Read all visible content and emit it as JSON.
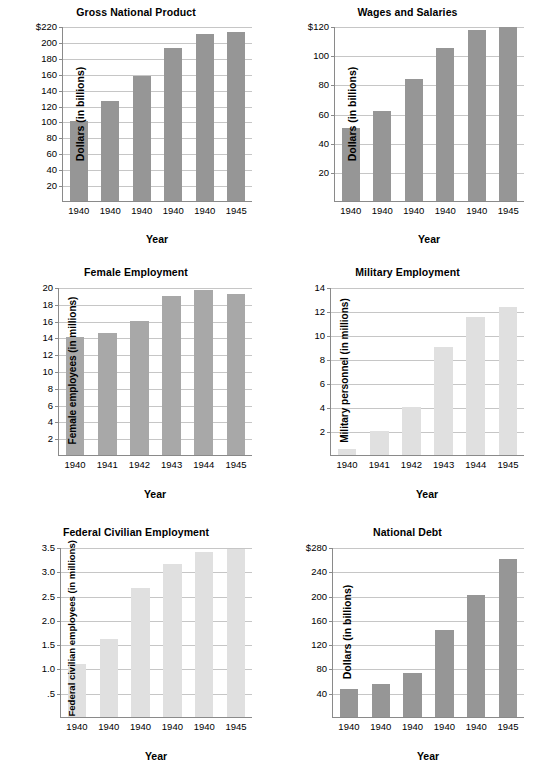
{
  "page": {
    "width": 543,
    "height": 778,
    "background": "#ffffff",
    "layout": "2 columns x 3 rows of bar charts"
  },
  "colors": {
    "bar_dark": "#969696",
    "bar_medium": "#a8a8a8",
    "bar_light": "#e0e0e0",
    "axis": "#8a8a8a",
    "gridline": "#c6c6c6",
    "text": "#000000"
  },
  "chart_data": [
    {
      "id": "gross-national-product",
      "type": "bar",
      "title": "Gross National Product",
      "xlabel": "Year",
      "ylabel": "Dollars (in billions)",
      "categories": [
        "1940",
        "1940",
        "1940",
        "1940",
        "1940",
        "1945"
      ],
      "values": [
        100,
        126,
        157,
        192,
        210,
        212
      ],
      "yticks": [
        "$220",
        "200",
        "180",
        "160",
        "140",
        "120",
        "100",
        "80",
        "60",
        "40",
        "20"
      ],
      "ytick_values": [
        220,
        200,
        180,
        160,
        140,
        120,
        100,
        80,
        60,
        40,
        20
      ],
      "ylim": [
        0,
        220
      ],
      "grid": true,
      "bar_color": "#969696"
    },
    {
      "id": "wages-and-salaries",
      "type": "bar",
      "title": "Wages and Salaries",
      "xlabel": "Year",
      "ylabel": "Dollars (in billions)",
      "categories": [
        "1940",
        "1940",
        "1940",
        "1940",
        "1940",
        "1945"
      ],
      "values": [
        50,
        62,
        84,
        105,
        117,
        119
      ],
      "yticks": [
        "$120",
        "100",
        "80",
        "60",
        "40",
        "20"
      ],
      "ytick_values": [
        120,
        100,
        80,
        60,
        40,
        20
      ],
      "ylim": [
        0,
        120
      ],
      "grid": true,
      "bar_color": "#969696"
    },
    {
      "id": "female-employment",
      "type": "bar",
      "title": "Female Employment",
      "xlabel": "Year",
      "ylabel": "Female employees (in millions)",
      "categories": [
        "1940",
        "1941",
        "1942",
        "1943",
        "1944",
        "1945"
      ],
      "values": [
        14.1,
        14.5,
        16.0,
        18.9,
        19.7,
        19.2
      ],
      "yticks": [
        "20",
        "18",
        "16",
        "14",
        "12",
        "10",
        "8",
        "6",
        "4",
        "2"
      ],
      "ytick_values": [
        20,
        18,
        16,
        14,
        12,
        10,
        8,
        6,
        4,
        2
      ],
      "ylim": [
        0,
        20
      ],
      "grid": true,
      "bar_color": "#a8a8a8"
    },
    {
      "id": "military-employment",
      "type": "bar",
      "title": "Military Employment",
      "xlabel": "Year",
      "ylabel": "Military personnel (in millions)",
      "categories": [
        "1940",
        "1941",
        "1942",
        "1943",
        "1944",
        "1945"
      ],
      "values": [
        0.5,
        2.0,
        4.0,
        9.0,
        11.5,
        12.3
      ],
      "yticks": [
        "14",
        "12",
        "10",
        "8",
        "6",
        "4",
        "2"
      ],
      "ytick_values": [
        14,
        12,
        10,
        8,
        6,
        4,
        2
      ],
      "ylim": [
        0,
        14
      ],
      "grid": true,
      "bar_color": "#e0e0e0"
    },
    {
      "id": "federal-civilian-employment",
      "type": "bar",
      "title": "Federal Civilian Employment",
      "xlabel": "Year",
      "ylabel": "Federal civilian employees (in millions)",
      "categories": [
        "1940",
        "1940",
        "1940",
        "1940",
        "1940",
        "1945"
      ],
      "values": [
        1.1,
        1.6,
        2.65,
        3.15,
        3.4,
        3.45
      ],
      "yticks": [
        "3.5",
        "3.0",
        "2.5",
        "2.0",
        "1.5",
        "1.0",
        ".5"
      ],
      "ytick_values": [
        3.5,
        3.0,
        2.5,
        2.0,
        1.5,
        1.0,
        0.5
      ],
      "ylim": [
        0,
        3.5
      ],
      "grid": true,
      "bar_color": "#e0e0e0"
    },
    {
      "id": "national-debt",
      "type": "bar",
      "title": "National Debt",
      "xlabel": "Year",
      "ylabel": "Dollars (in billions)",
      "categories": [
        "1940",
        "1940",
        "1940",
        "1940",
        "1940",
        "1945"
      ],
      "values": [
        46,
        55,
        73,
        143,
        201,
        261
      ],
      "yticks": [
        "$280",
        "240",
        "200",
        "160",
        "120",
        "80",
        "40"
      ],
      "ytick_values": [
        280,
        240,
        200,
        160,
        120,
        80,
        40
      ],
      "ylim": [
        0,
        280
      ],
      "grid": true,
      "bar_color": "#969696"
    }
  ]
}
